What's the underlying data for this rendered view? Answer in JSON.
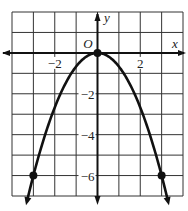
{
  "chart_data": {
    "type": "line",
    "title": "",
    "xlabel": "x",
    "ylabel": "y",
    "origin_label": "O",
    "xlim": [
      -4,
      4
    ],
    "ylim": [
      -7,
      2
    ],
    "grid": true,
    "x_ticks": [
      {
        "value": -2,
        "label": "−2"
      },
      {
        "value": 2,
        "label": "2"
      }
    ],
    "y_ticks": [
      {
        "value": -2,
        "label": "−2"
      },
      {
        "value": -4,
        "label": "−4"
      },
      {
        "value": -6,
        "label": "−6"
      }
    ],
    "series": [
      {
        "name": "y = -2/3 x^2",
        "equation": "y = -(2/3)x^2",
        "x": [
          -3.3,
          -3,
          -2,
          -1,
          0,
          1,
          2,
          3,
          3.3
        ],
        "y": [
          -7.26,
          -6,
          -2.67,
          -0.67,
          0,
          -0.67,
          -2.67,
          -6,
          -7.26
        ]
      }
    ],
    "marked_points": [
      {
        "x": -3,
        "y": -6
      },
      {
        "x": 0,
        "y": 0
      },
      {
        "x": 3,
        "y": -6
      }
    ]
  }
}
